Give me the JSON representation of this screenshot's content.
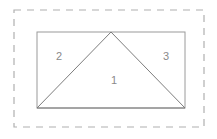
{
  "figure": {
    "canvas": {
      "width": 217,
      "height": 139,
      "background": "#ffffff"
    },
    "colors": {
      "dashed_border": "#b0b0b0",
      "rectangle_stroke": "#9a9a9a",
      "triangle_stroke": "#7d7d7d",
      "label_text": "#8a8a8a",
      "fill": "#ffffff"
    },
    "bounding_box": {
      "name": "dashed-selection-box",
      "x": 14,
      "y": 10,
      "width": 190,
      "height": 117,
      "stroke_dasharray": "7 6",
      "stroke_width": 1.2
    },
    "rectangle": {
      "name": "outer-rectangle",
      "x": 37,
      "y": 32,
      "width": 148,
      "height": 76,
      "stroke_width": 1
    },
    "triangle": {
      "name": "inscribed-triangle",
      "points": "37,108 111,32 185,108",
      "apex": {
        "x": 111,
        "y": 32
      },
      "base_left": {
        "x": 37,
        "y": 108
      },
      "base_right": {
        "x": 185,
        "y": 108
      },
      "stroke_width": 1
    },
    "regions": [
      {
        "id": "region-1",
        "label": "1",
        "x": 114,
        "y": 81,
        "description": "central triangle"
      },
      {
        "id": "region-2",
        "label": "2",
        "x": 59,
        "y": 57,
        "description": "left corner triangle"
      },
      {
        "id": "region-3",
        "label": "3",
        "x": 166,
        "y": 57,
        "description": "right corner triangle"
      }
    ]
  }
}
